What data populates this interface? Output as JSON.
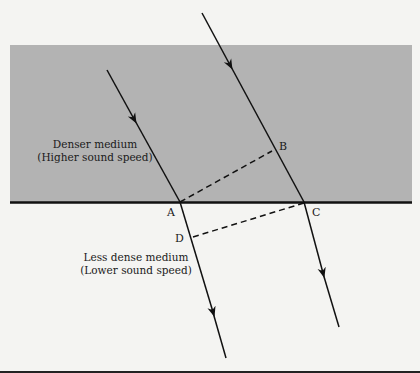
{
  "diagram": {
    "colors": {
      "background": "#f4f4f2",
      "dense_medium": "#b3b3b3",
      "line": "#111111"
    },
    "media": {
      "upper": {
        "line1": "Denser medium",
        "line2": "(Higher sound speed)"
      },
      "lower": {
        "line1": "Less dense medium",
        "line2": "(Lower sound speed)"
      }
    },
    "points": {
      "A": "A",
      "B": "B",
      "C": "C",
      "D": "D"
    }
  }
}
